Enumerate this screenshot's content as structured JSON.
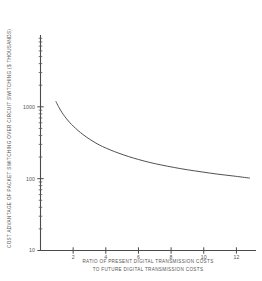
{
  "chart_data": {
    "type": "line",
    "title": "",
    "xlabel": "RATIO OF PRESENT DIGITAL TRANSMISSION COSTS TO FUTURE DIGITAL TRANSMISSION COSTS",
    "xlabel_line1": "RATIO OF PRESENT DIGITAL TRANSMISSION COSTS",
    "xlabel_line2": "TO FUTURE DIGITAL TRANSMISSION COSTS",
    "ylabel": "COST ADVANTAGE OF PACKET SWITCHING OVER CIRCUIT SWITCHING ($ THOUSANDS)",
    "xscale": "linear",
    "yscale": "log",
    "xlim": [
      0,
      13.2
    ],
    "ylim": [
      10,
      10000
    ],
    "grid": false,
    "legend": null,
    "xticks": [
      2,
      4,
      6,
      8,
      10,
      12
    ],
    "xticklabels": [
      "2",
      "4",
      "6",
      "8",
      "10",
      "12"
    ],
    "yticks": [
      10,
      100,
      1000
    ],
    "yticklabels": [
      "10",
      "100",
      "1000"
    ],
    "yminorticks": [
      20,
      30,
      40,
      50,
      60,
      70,
      80,
      90,
      200,
      300,
      400,
      500,
      600,
      700,
      800,
      900,
      2000,
      3000,
      4000,
      5000,
      6000,
      7000,
      8000,
      9000
    ],
    "series": [
      {
        "name": "cost advantage",
        "x": [
          0.95,
          1.1,
          1.25,
          1.4,
          1.6,
          1.8,
          2.0,
          2.3,
          2.6,
          3.0,
          3.4,
          3.8,
          4.3,
          4.8,
          5.4,
          6.0,
          6.7,
          7.4,
          8.2,
          9.0,
          9.9,
          10.8,
          11.8,
          12.8
        ],
        "y": [
          1180,
          1010,
          880,
          780,
          680,
          600,
          540,
          468,
          412,
          355,
          312,
          280,
          250,
          226,
          203,
          185,
          168,
          155,
          143,
          133,
          124,
          116,
          109,
          102
        ]
      }
    ]
  },
  "axis_titles": {
    "y": "COST ADVANTAGE OF PACKET SWITCHING OVER CIRCUIT SWITCHING ($ THOUSANDS)",
    "x_line1": "RATIO OF PRESENT DIGITAL TRANSMISSION COSTS",
    "x_line2": "TO FUTURE DIGITAL TRANSMISSION COSTS"
  },
  "colors": {
    "axis": "#4a4a4a",
    "curve": "#3c3c3c",
    "text": "#555555",
    "background": "#ffffff"
  }
}
